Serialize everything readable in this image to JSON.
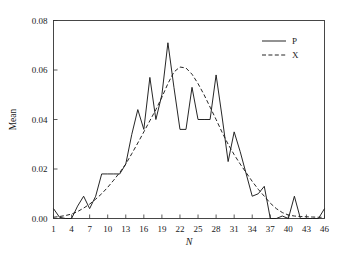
{
  "chart_data": {
    "type": "line",
    "title": "",
    "xlabel": "N",
    "ylabel": "Mean",
    "xlim": [
      1,
      46
    ],
    "ylim": [
      0.0,
      0.08
    ],
    "grid": false,
    "legend_position": "top-right",
    "xticks": [
      1,
      4,
      7,
      10,
      13,
      16,
      19,
      22,
      25,
      28,
      31,
      34,
      37,
      40,
      43,
      46
    ],
    "xtick_labels": [
      "1",
      "4",
      "7",
      "10",
      "13",
      "16",
      "19",
      "22",
      "25",
      "28",
      "31",
      "34",
      "37",
      "40",
      "43",
      "46"
    ],
    "yticks": [
      0.0,
      0.02,
      0.04,
      0.06,
      0.08
    ],
    "ytick_labels": [
      "0.00",
      "0.02",
      "0.04",
      "0.06",
      "0.08"
    ],
    "x": [
      1,
      2,
      3,
      4,
      5,
      6,
      7,
      8,
      9,
      10,
      11,
      12,
      13,
      14,
      15,
      16,
      17,
      18,
      19,
      20,
      21,
      22,
      23,
      24,
      25,
      26,
      27,
      28,
      29,
      30,
      31,
      32,
      33,
      34,
      35,
      36,
      37,
      38,
      39,
      40,
      41,
      42,
      43,
      44,
      45,
      46
    ],
    "series": [
      {
        "name": "P",
        "style": "solid",
        "color": "#1a1a1a",
        "values": [
          0.004,
          0.0005,
          0.0,
          0.0,
          0.005,
          0.009,
          0.004,
          0.009,
          0.018,
          0.018,
          0.018,
          0.018,
          0.022,
          0.034,
          0.044,
          0.036,
          0.057,
          0.04,
          0.05,
          0.071,
          0.053,
          0.036,
          0.036,
          0.053,
          0.04,
          0.04,
          0.04,
          0.058,
          0.041,
          0.023,
          0.035,
          0.027,
          0.018,
          0.009,
          0.01,
          0.013,
          0.0,
          0.0,
          0.001,
          0.0,
          0.009,
          0.0,
          0.0,
          0.0,
          0.0,
          0.004
        ]
      },
      {
        "name": "X",
        "style": "dashed",
        "color": "#1a1a1a",
        "values": [
          0.0005,
          0.0008,
          0.0012,
          0.0018,
          0.0028,
          0.0042,
          0.0058,
          0.0078,
          0.01,
          0.0126,
          0.0155,
          0.0186,
          0.022,
          0.0262,
          0.0305,
          0.035,
          0.0395,
          0.044,
          0.049,
          0.0545,
          0.0592,
          0.0612,
          0.0608,
          0.0583,
          0.0545,
          0.05,
          0.045,
          0.04,
          0.0348,
          0.03,
          0.0258,
          0.022,
          0.0185,
          0.015,
          0.0118,
          0.009,
          0.0062,
          0.004,
          0.0024,
          0.0014,
          0.001,
          0.0008,
          0.0007,
          0.0006,
          0.0005,
          0.0005
        ]
      }
    ],
    "legend": [
      {
        "label": "P",
        "style": "solid"
      },
      {
        "label": "X",
        "style": "dashed"
      }
    ]
  }
}
